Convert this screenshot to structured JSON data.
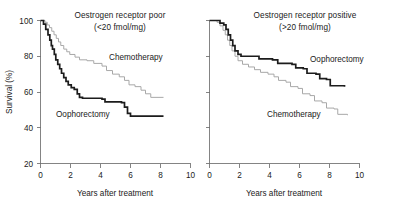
{
  "figure": {
    "caption": "Kaplan-Meier survival curves by oestrogen receptor status",
    "colors": {
      "oophorectomy": "#1c1c1c",
      "chemotherapy": "#a8a8a8",
      "axis": "#6e6e6e",
      "background": "#ffffff"
    }
  },
  "chart_data": [
    {
      "type": "line",
      "panel": "left",
      "title": "Oestrogen receptor poor",
      "subtitle": "(<20 fmol/mg)",
      "xlabel": "Years after treatment",
      "ylabel": "Survival (%)",
      "xlim": [
        0,
        10
      ],
      "ylim": [
        20,
        100
      ],
      "xticks": [
        0,
        2,
        4,
        6,
        8,
        10
      ],
      "xticklabels": [
        "0",
        "2",
        "4",
        "6",
        "8",
        "10"
      ],
      "yticks": [
        20,
        40,
        60,
        80,
        100
      ],
      "yticklabels": [
        "20",
        "40",
        "60",
        "80",
        "100"
      ],
      "grid": false,
      "legend": "inline-annotation",
      "annotations": [
        {
          "text": "Chemotherapy",
          "x": 4.55,
          "y": 80.5
        },
        {
          "text": "Oophorectomy",
          "x": 1.45,
          "y": 51.0
        }
      ],
      "series": [
        {
          "name": "Chemotherapy",
          "color": "#a8a8a8",
          "step": "post",
          "points": [
            [
              0.0,
              100.0
            ],
            [
              0.3,
              99.0
            ],
            [
              0.45,
              97.5
            ],
            [
              0.6,
              96.0
            ],
            [
              0.75,
              94.0
            ],
            [
              0.9,
              92.0
            ],
            [
              1.05,
              90.0
            ],
            [
              1.2,
              88.0
            ],
            [
              1.35,
              86.0
            ],
            [
              1.55,
              84.0
            ],
            [
              1.75,
              82.5
            ],
            [
              1.95,
              81.0
            ],
            [
              2.3,
              79.5
            ],
            [
              2.6,
              78.0
            ],
            [
              3.1,
              77.5
            ],
            [
              3.55,
              76.0
            ],
            [
              4.1,
              74.5
            ],
            [
              4.4,
              72.0
            ],
            [
              4.8,
              70.0
            ],
            [
              5.25,
              68.5
            ],
            [
              5.6,
              66.5
            ],
            [
              5.9,
              64.0
            ],
            [
              6.3,
              63.0
            ],
            [
              6.7,
              61.0
            ],
            [
              7.0,
              59.0
            ],
            [
              7.35,
              57.0
            ],
            [
              8.2,
              57.0
            ]
          ]
        },
        {
          "name": "Oophorectomy",
          "color": "#1c1c1c",
          "step": "post",
          "points": [
            [
              0.0,
              100.0
            ],
            [
              0.2,
              98.0
            ],
            [
              0.35,
              95.0
            ],
            [
              0.5,
              92.0
            ],
            [
              0.62,
              89.0
            ],
            [
              0.72,
              86.0
            ],
            [
              0.8,
              84.0
            ],
            [
              0.92,
              81.0
            ],
            [
              1.02,
              78.0
            ],
            [
              1.15,
              75.5
            ],
            [
              1.28,
              73.0
            ],
            [
              1.4,
              70.5
            ],
            [
              1.55,
              68.0
            ],
            [
              1.7,
              66.0
            ],
            [
              1.85,
              64.0
            ],
            [
              2.05,
              62.5
            ],
            [
              2.25,
              61.5
            ],
            [
              2.45,
              59.0
            ],
            [
              2.6,
              57.0
            ],
            [
              2.8,
              56.5
            ],
            [
              4.1,
              56.0
            ],
            [
              4.3,
              54.5
            ],
            [
              5.4,
              54.0
            ],
            [
              5.6,
              51.5
            ],
            [
              5.8,
              48.0
            ],
            [
              6.0,
              46.5
            ],
            [
              8.2,
              46.5
            ]
          ]
        }
      ]
    },
    {
      "type": "line",
      "panel": "right",
      "title": "Oestrogen receptor positive",
      "subtitle": "(>20 fmol/mg)",
      "xlabel": "Years after treatment",
      "ylabel": "",
      "xlim": [
        0,
        10
      ],
      "ylim": [
        20,
        100
      ],
      "xticks": [
        0,
        2,
        4,
        6,
        8,
        10
      ],
      "xticklabels": [
        "0",
        "2",
        "4",
        "6",
        "8",
        "10"
      ],
      "yticks": [
        20,
        40,
        60,
        80,
        100
      ],
      "yticklabels": [],
      "grid": false,
      "legend": "inline-annotation",
      "annotations": [
        {
          "text": "Oophorectomy",
          "x": 5.55,
          "y": 79.0
        },
        {
          "text": "Chemotherapy",
          "x": 3.15,
          "y": 51.5
        }
      ],
      "series": [
        {
          "name": "Oophorectomy",
          "color": "#1c1c1c",
          "step": "post",
          "points": [
            [
              0.0,
              100.0
            ],
            [
              0.55,
              100.0
            ],
            [
              0.7,
              98.5
            ],
            [
              0.95,
              97.5
            ],
            [
              1.1,
              95.0
            ],
            [
              1.25,
              92.0
            ],
            [
              1.4,
              89.0
            ],
            [
              1.55,
              86.0
            ],
            [
              1.7,
              83.0
            ],
            [
              1.9,
              81.0
            ],
            [
              2.1,
              80.0
            ],
            [
              3.0,
              80.0
            ],
            [
              3.3,
              78.5
            ],
            [
              4.2,
              78.0
            ],
            [
              4.55,
              76.0
            ],
            [
              5.5,
              75.5
            ],
            [
              5.75,
              73.5
            ],
            [
              6.25,
              73.0
            ],
            [
              6.5,
              70.5
            ],
            [
              7.1,
              70.0
            ],
            [
              7.35,
              67.5
            ],
            [
              7.8,
              67.0
            ],
            [
              8.05,
              63.5
            ],
            [
              9.0,
              63.0
            ]
          ]
        },
        {
          "name": "Chemotherapy",
          "color": "#a8a8a8",
          "step": "post",
          "points": [
            [
              0.0,
              100.0
            ],
            [
              0.5,
              99.0
            ],
            [
              0.7,
              97.0
            ],
            [
              0.9,
              94.5
            ],
            [
              1.05,
              92.0
            ],
            [
              1.2,
              89.0
            ],
            [
              1.35,
              86.0
            ],
            [
              1.5,
              83.0
            ],
            [
              1.7,
              80.0
            ],
            [
              1.9,
              77.5
            ],
            [
              2.2,
              75.5
            ],
            [
              2.6,
              74.0
            ],
            [
              3.0,
              72.5
            ],
            [
              3.4,
              71.0
            ],
            [
              3.9,
              70.0
            ],
            [
              4.3,
              68.5
            ],
            [
              4.6,
              66.5
            ],
            [
              5.1,
              65.5
            ],
            [
              5.4,
              63.0
            ],
            [
              5.9,
              62.0
            ],
            [
              6.2,
              59.0
            ],
            [
              6.7,
              58.0
            ],
            [
              7.0,
              55.0
            ],
            [
              7.5,
              54.0
            ],
            [
              7.8,
              51.0
            ],
            [
              8.3,
              50.5
            ],
            [
              8.55,
              47.5
            ],
            [
              9.2,
              47.0
            ]
          ]
        }
      ]
    }
  ],
  "panels": {
    "left": {
      "title": "Oestrogen receptor poor",
      "subtitle": "(<20 fmol/mg)",
      "xlabel": "Years after treatment",
      "ylabel": "Survival (%)",
      "label_chemotherapy": "Chemotherapy",
      "label_oophorectomy": "Oophorectomy",
      "xticklabels": [
        "0",
        "2",
        "4",
        "6",
        "8",
        "10"
      ],
      "yticklabels": [
        "20",
        "40",
        "60",
        "80",
        "100"
      ]
    },
    "right": {
      "title": "Oestrogen receptor positive",
      "subtitle": "(>20 fmol/mg)",
      "xlabel": "Years after treatment",
      "ylabel": "",
      "label_chemotherapy": "Chemotherapy",
      "label_oophorectomy": "Oophorectomy",
      "xticklabels": [
        "0",
        "2",
        "4",
        "6",
        "8",
        "10"
      ],
      "yticklabels": []
    }
  }
}
